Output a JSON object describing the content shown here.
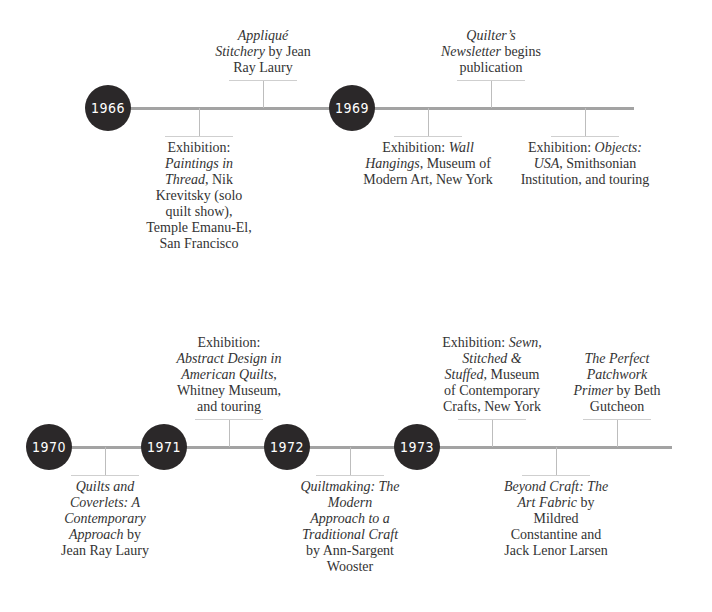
{
  "rows": [
    {
      "line": {
        "y": 108,
        "x1": 108,
        "x2": 634
      },
      "years": [
        {
          "label": "1966",
          "x": 108
        },
        {
          "label": "1969",
          "x": 352
        }
      ],
      "events": [
        {
          "x": 263,
          "side": "above",
          "parts": [
            {
              "t": "Appliqué",
              "i": true
            },
            {
              "t": " "
            },
            {
              "t": "Stitchery",
              "i": true
            },
            {
              "t": " by Jean Ray Laury"
            }
          ],
          "width": 100
        },
        {
          "x": 199,
          "side": "below",
          "parts": [
            {
              "t": "Exhibition: "
            },
            {
              "t": "Paintings in Thread",
              "i": true
            },
            {
              "t": ", Nik Krevitsky (solo quilt show), Temple Emanu-El, San Francisco"
            }
          ],
          "width": 110
        },
        {
          "x": 491,
          "side": "above",
          "parts": [
            {
              "t": "Quilter’s Newsletter",
              "i": true
            },
            {
              "t": " begins publication"
            }
          ],
          "width": 100
        },
        {
          "x": 428,
          "side": "below",
          "parts": [
            {
              "t": "Exhibition: "
            },
            {
              "t": "Wall Hangings",
              "i": true
            },
            {
              "t": ", Museum of Modern Art, New York"
            }
          ],
          "width": 140
        },
        {
          "x": 585,
          "side": "below",
          "parts": [
            {
              "t": "Exhibition: "
            },
            {
              "t": "Objects: USA",
              "i": true
            },
            {
              "t": ", Smithsonian Institution, and touring"
            }
          ],
          "width": 140
        }
      ]
    },
    {
      "line": {
        "y": 447,
        "x1": 49,
        "x2": 672
      },
      "years": [
        {
          "label": "1970",
          "x": 49
        },
        {
          "label": "1971",
          "x": 164
        },
        {
          "label": "1972",
          "x": 287
        },
        {
          "label": "1973",
          "x": 417
        }
      ],
      "events": [
        {
          "x": 105,
          "side": "below",
          "parts": [
            {
              "t": "Quilts and Coverlets: A Contemporary Approach",
              "i": true
            },
            {
              "t": " by Jean Ray Laury"
            }
          ],
          "width": 100
        },
        {
          "x": 229,
          "side": "above",
          "parts": [
            {
              "t": "Exhibition: "
            },
            {
              "t": "Abstract Design in American Quilts",
              "i": true
            },
            {
              "t": ", Whitney Museum, and touring"
            }
          ],
          "width": 110
        },
        {
          "x": 350,
          "side": "below",
          "parts": [
            {
              "t": "Quiltmaking: The Modern Approach to a Traditional Craft",
              "i": true
            },
            {
              "t": " by Ann-Sargent Wooster"
            }
          ],
          "width": 100
        },
        {
          "x": 492,
          "side": "above",
          "parts": [
            {
              "t": "Exhibition: "
            },
            {
              "t": "Sewn, Stitched & Stuffed",
              "i": true
            },
            {
              "t": ", Museum of Contemporary Crafts, New York"
            }
          ],
          "width": 105
        },
        {
          "x": 556,
          "side": "below",
          "parts": [
            {
              "t": "Beyond Craft: The Art Fabric",
              "i": true
            },
            {
              "t": " by Mildred Constantine and Jack Lenor Larsen"
            }
          ],
          "width": 115
        },
        {
          "x": 617,
          "side": "above",
          "parts": [
            {
              "t": "The Perfect Patchwork Primer",
              "i": true
            },
            {
              "t": " by Beth Gutcheon"
            }
          ],
          "width": 100
        }
      ]
    }
  ],
  "colors": {
    "circle": "#2b2829",
    "line": "#a3a3a3"
  }
}
